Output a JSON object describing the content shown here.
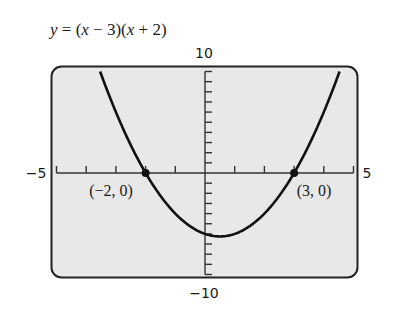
{
  "chart_data": {
    "type": "line",
    "title": "y = (x − 3)(x + 2)",
    "equation": {
      "lhs": "y",
      "rhs": "(x − 3)(x + 2)"
    },
    "xlabel": "",
    "ylabel": "",
    "xlim": [
      -5,
      5
    ],
    "ylim": [
      -10,
      10
    ],
    "x_tick_step": 1,
    "y_tick_step": 1,
    "grid": false,
    "axis_labels": {
      "xmin": "−5",
      "xmax": "5",
      "ymin": "−10",
      "ymax": "10"
    },
    "series": [
      {
        "name": "y = (x − 3)(x + 2)",
        "function": "x^2 - x - 6",
        "x": [
          -3.53,
          -3,
          -2,
          -1,
          0,
          0.5,
          1,
          2,
          3,
          4,
          4.53
        ],
        "values": [
          10,
          6,
          0,
          -4,
          -6,
          -6.25,
          -6,
          -4,
          0,
          6,
          10
        ]
      }
    ],
    "annotations": [
      {
        "label": "(−2, 0)",
        "x": -2,
        "y": 0
      },
      {
        "label": "(3, 0)",
        "x": 3,
        "y": 0
      }
    ],
    "colors": {
      "background": "#e8e8e8",
      "curve": "#111111",
      "frame": "#222222"
    }
  }
}
